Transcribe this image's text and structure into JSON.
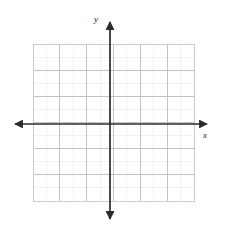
{
  "figure": {
    "kind": "blank-cartesian-coordinate-grid",
    "background_color": "#ffffff",
    "width": 227,
    "height": 236
  },
  "axes": {
    "x_label": "x",
    "y_label": "y",
    "axis_color": "#2b2b2b",
    "axis_line_width": 1.6,
    "arrowheads": [
      "left",
      "right",
      "up",
      "down"
    ],
    "origin": {
      "x": 110,
      "y": 124
    }
  },
  "grid": {
    "columns": 12,
    "rows": 12,
    "left": 33,
    "top": 44,
    "right": 194,
    "bottom": 201,
    "cell_width": 13.42,
    "cell_height": 13.08,
    "major_line_color": "#b9bcc4",
    "minor_line_color": "#e4e6ea",
    "border_color": "#c4c7cd",
    "major_line_width": 0.9,
    "minor_line_width": 0.6
  },
  "chart_data": {
    "type": "scatter",
    "title": "",
    "xlabel": "x",
    "ylabel": "y",
    "xlim": [
      -6,
      6
    ],
    "ylim": [
      -6,
      6
    ],
    "x_tick_labels": [],
    "y_tick_labels": [],
    "grid": true,
    "legend": null,
    "series": [],
    "annotations": [],
    "note": "Empty graph paper: 12 x 12 unit grid with unlabeled x and y axes crossing at the origin; no data plotted."
  }
}
